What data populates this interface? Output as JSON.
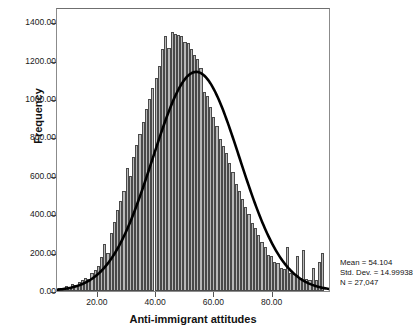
{
  "chart_data": {
    "type": "bar",
    "title": "",
    "xlabel": "Anti-immigrant attitudes",
    "ylabel": "Frequency",
    "xlim": [
      6,
      100
    ],
    "ylim": [
      0,
      1480
    ],
    "grid": false,
    "legend": null,
    "xticks": [
      "20.00",
      "40.00",
      "60.00",
      "80.00"
    ],
    "xtick_values": [
      20,
      40,
      60,
      80
    ],
    "yticks": [
      "0.00",
      "200.00",
      "400.00",
      "600.00",
      "800.00",
      "1000.00",
      "1200.00",
      "1400.00"
    ],
    "ytick_values": [
      0,
      200,
      400,
      600,
      800,
      1000,
      1200,
      1400
    ],
    "bin_width": 1.1,
    "bar_color": "#b9b9b9",
    "bar_edge_color": "#4a4a4a",
    "curve_color": "#000000",
    "categories": [
      7.0,
      8.1,
      9.2,
      10.3,
      11.4,
      12.5,
      13.6,
      14.7,
      15.8,
      16.9,
      18.0,
      19.1,
      20.2,
      21.3,
      22.4,
      23.5,
      24.6,
      25.7,
      26.8,
      27.9,
      29.0,
      30.1,
      31.2,
      32.3,
      33.4,
      34.5,
      35.6,
      36.7,
      37.8,
      38.9,
      40.0,
      41.1,
      42.2,
      43.3,
      44.4,
      45.5,
      46.6,
      47.7,
      48.8,
      49.9,
      51.0,
      52.1,
      53.2,
      54.3,
      55.4,
      56.5,
      57.6,
      58.7,
      59.8,
      60.9,
      62.0,
      63.1,
      64.2,
      65.3,
      66.4,
      67.5,
      68.6,
      69.7,
      70.8,
      71.9,
      73.0,
      74.1,
      75.2,
      76.3,
      77.4,
      78.5,
      79.6,
      80.7,
      81.8,
      82.9,
      84.0,
      85.1,
      86.2,
      87.3,
      88.4,
      89.5,
      90.6,
      91.7,
      92.8,
      93.9,
      95.0,
      96.1,
      97.2
    ],
    "values": [
      18,
      12,
      25,
      22,
      35,
      30,
      48,
      55,
      70,
      62,
      95,
      110,
      130,
      175,
      245,
      200,
      300,
      360,
      420,
      470,
      520,
      640,
      600,
      700,
      760,
      820,
      880,
      950,
      1000,
      1060,
      1110,
      1175,
      1260,
      1330,
      1265,
      1350,
      1340,
      1335,
      1330,
      1300,
      1290,
      1260,
      1230,
      1210,
      1160,
      1035,
      1015,
      960,
      905,
      860,
      790,
      755,
      720,
      665,
      620,
      560,
      520,
      480,
      440,
      400,
      355,
      330,
      290,
      255,
      230,
      190,
      180,
      150,
      145,
      120,
      115,
      230,
      95,
      90,
      180,
      70,
      215,
      65,
      60,
      120,
      55,
      150,
      200
    ],
    "normal_curve": {
      "mean": 54.104,
      "std_dev": 14.99938,
      "peak_value": 1150
    }
  },
  "stats_box": {
    "mean_label": "Mean = 54.104",
    "std_dev_label": "Std. Dev. = 14.99938",
    "n_label": "N = 27,047"
  }
}
